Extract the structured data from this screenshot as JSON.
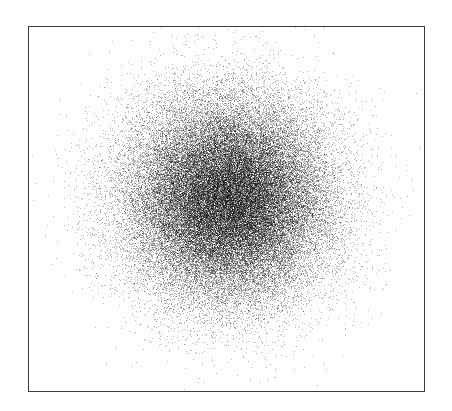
{
  "figure": {
    "width": 452,
    "height": 411,
    "background_color": "#ffffff",
    "title": "",
    "has_title": false,
    "has_legend": false,
    "has_gridlines": false,
    "has_tick_marks": false,
    "has_tick_labels": false
  },
  "frame": {
    "name": "plot-frame",
    "left": 28,
    "top": 26,
    "width": 397,
    "height": 366,
    "border_color": "#3b3b3f",
    "border_width_px": 1,
    "fill_color": "#ffffff"
  },
  "chart_data": {
    "type": "scatter",
    "title": "",
    "subtitle": "",
    "xlabel": "",
    "ylabel": "",
    "xlim": [
      -4,
      4
    ],
    "ylim": [
      -4,
      4
    ],
    "xticks": [],
    "yticks": [],
    "xticklabels": [],
    "yticklabels": [],
    "grid": false,
    "legend": false,
    "legend_position": "none",
    "annotations": [],
    "series": [
      {
        "name": "points",
        "marker": "point",
        "marker_size_px": 1,
        "color": "#000000",
        "opacity": 0.28,
        "n_points": 60000,
        "distribution": "bivariate-gaussian",
        "mean_x": 0.0,
        "mean_y": 0.07,
        "std_x": 1.0,
        "std_y": 1.0,
        "correlation": 0.0,
        "center_px": {
          "x": 228,
          "y": 200
        },
        "radius_px": 152,
        "visible_extent_px": {
          "left": 78,
          "right": 382,
          "top": 56,
          "bottom": 370
        },
        "core_saturation": "opaque-black",
        "halo_falloff": "gaussian"
      }
    ]
  },
  "seed": 20240517
}
